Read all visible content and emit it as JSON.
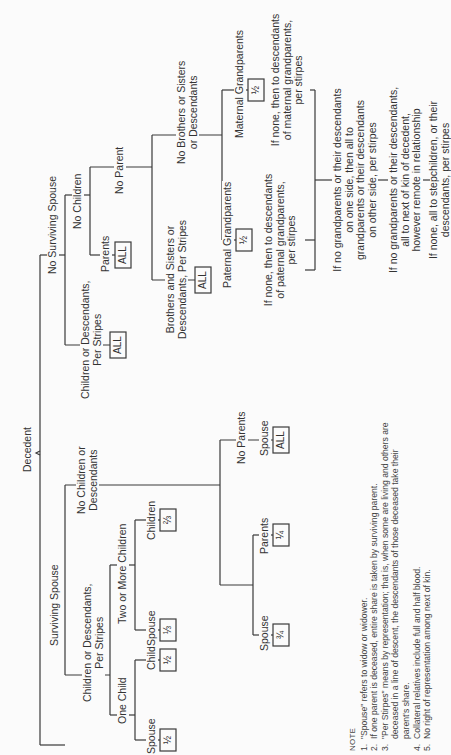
{
  "diagram": {
    "root": "Decedent",
    "surviving_spouse": {
      "label": "Surviving Spouse",
      "children_branch": {
        "label": "Children or Descendants, Per Stripes",
        "label_lines": [
          "Children or Descendants,",
          "Per Stripes"
        ],
        "one_child": {
          "label": "One Child",
          "spouse": {
            "label": "Spouse",
            "share": "½"
          },
          "child": {
            "label": "Child",
            "share": "½"
          }
        },
        "two_or_more": {
          "label": "Two or More Children",
          "spouse": {
            "label": "Spouse",
            "share": "⅓"
          },
          "children": {
            "label": "Children",
            "share": "⅔"
          }
        }
      },
      "no_children_branch": {
        "label": "No Children or Descendants",
        "label_lines": [
          "No Children or",
          "Descendants"
        ],
        "parents_case": {
          "spouse": {
            "label": "Spouse",
            "share": "¾"
          },
          "parents": {
            "label": "Parents",
            "share": "¼"
          }
        },
        "no_parents": {
          "label": "No Parents",
          "spouse": {
            "label": "Spouse",
            "share": "ALL"
          }
        }
      }
    },
    "no_surviving_spouse": {
      "label": "No Surviving Spouse",
      "children_branch": {
        "label_lines": [
          "Children or Descendants,",
          "Per Stripes"
        ],
        "share": "ALL"
      },
      "no_children": {
        "label": "No Children",
        "parents": {
          "label": "Parents",
          "share": "ALL"
        },
        "no_parent": {
          "label": "No Parent",
          "siblings": {
            "label_lines": [
              "Brothers and Sisters or",
              "Descendants, Per Stripes"
            ],
            "share": "ALL"
          },
          "no_siblings": {
            "label_lines": [
              "No Brothers or Sisters",
              "or Descendants"
            ],
            "paternal": {
              "label": "Paternal Grandparents",
              "share": "½",
              "fallback_lines": [
                "If none, then to descendants",
                "of paternal grandparents,",
                "per stirpes"
              ]
            },
            "maternal": {
              "label": "Maternal Grandparents",
              "share": "½",
              "fallback_lines": [
                "If none, then to descendants",
                "of maternal grandparents,",
                "per stirpes"
              ]
            },
            "chain": [
              {
                "lines": [
                  "If no grandparents or their descendants",
                  "on one side, then all to",
                  "grandparents or their descendants",
                  "on other side, per stirpes"
                ]
              },
              {
                "lines": [
                  "If no grandparents or their descendants,",
                  "all to next of kin of decedent,",
                  "however remote in relationship"
                ]
              },
              {
                "lines": [
                  "If none, all to stepchildren, or their",
                  "descendants, per stirpes"
                ]
              }
            ]
          }
        }
      }
    }
  },
  "notes": {
    "title": "NOTE",
    "items": [
      {
        "num": "1.",
        "text": "\"Spouse\" refers to widow or widower."
      },
      {
        "num": "2.",
        "text": "If one parent is deceased, entire share is taken by surviving parent."
      },
      {
        "num": "3.",
        "text": "\"Per Stirpes\" means by representation; that is, when some are living and others are deceased in a line of descent, the descendants of those deceased take their parent's share."
      },
      {
        "num": "4.",
        "text": "Collateral relatives include full and half blood."
      },
      {
        "num": "5.",
        "text": "No right of representation among next of kin."
      }
    ]
  }
}
